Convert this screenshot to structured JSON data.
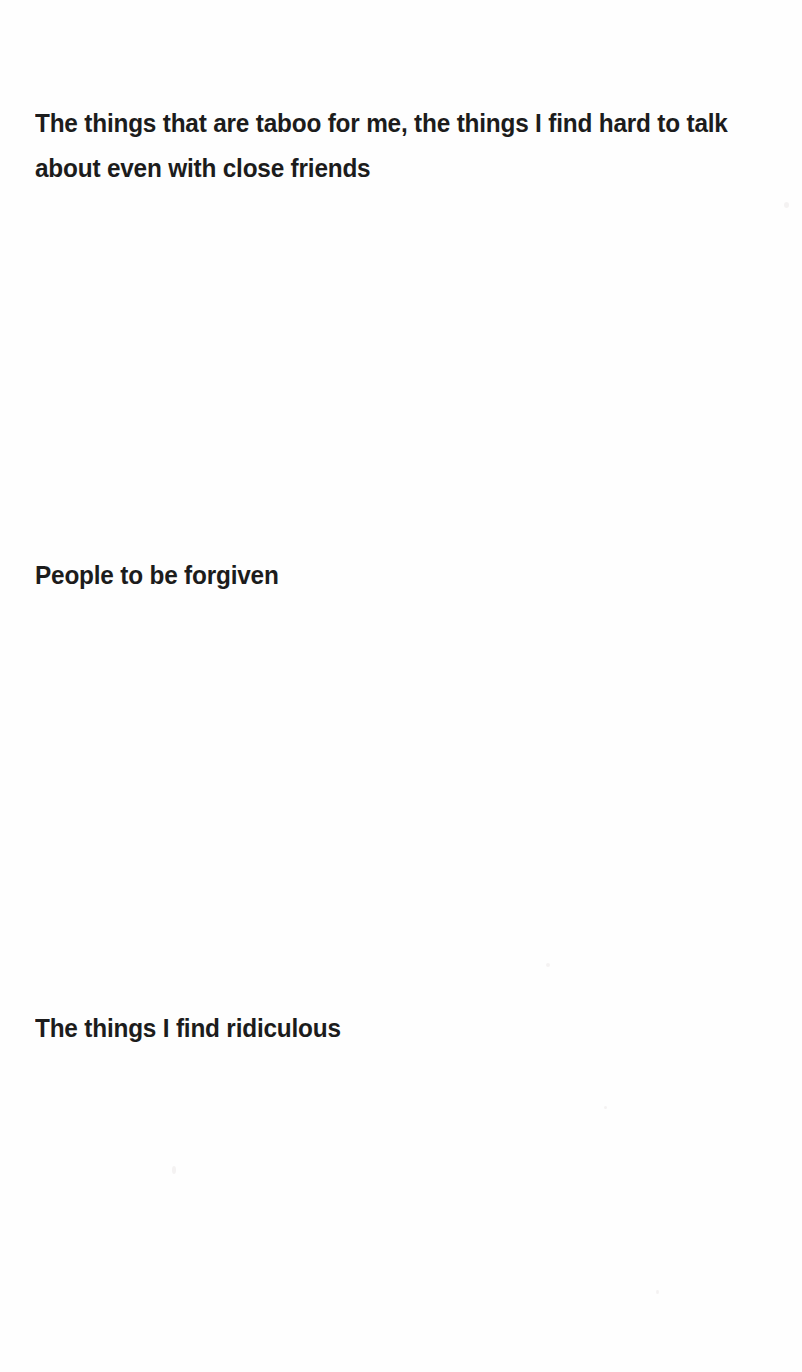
{
  "document": {
    "background_color": "#fefefe",
    "text_color": "#1c1c1c",
    "page_width": 802,
    "page_height": 1372,
    "headings": [
      {
        "id": "taboo",
        "text": "The things that are taboo for me, the things I find hard to talk about even with close friends"
      },
      {
        "id": "forgiven",
        "text": "People to be forgiven"
      },
      {
        "id": "ridiculous",
        "text": "The things I find ridiculous"
      }
    ]
  }
}
